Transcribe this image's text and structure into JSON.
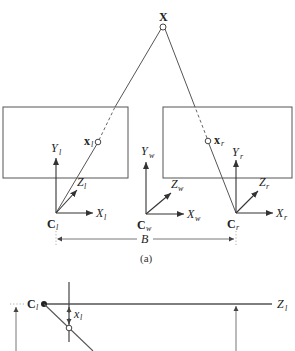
{
  "diagram": {
    "world_point": {
      "label": "X"
    },
    "left_camera": {
      "image_point": {
        "label": "x",
        "subscript": "l"
      },
      "center": {
        "label": "C",
        "subscript": "l"
      },
      "axes": {
        "x": {
          "label": "X",
          "sub": "l"
        },
        "y": {
          "label": "Y",
          "sub": "l"
        },
        "z": {
          "label": "Z",
          "sub": "l"
        }
      }
    },
    "world_frame": {
      "center": {
        "label": "C",
        "subscript": "w"
      },
      "axes": {
        "x": {
          "label": "X",
          "sub": "w"
        },
        "y": {
          "label": "Y",
          "sub": "w"
        },
        "z": {
          "label": "Z",
          "sub": "w"
        }
      }
    },
    "right_camera": {
      "image_point": {
        "label": "x",
        "subscript": "r"
      },
      "center": {
        "label": "C",
        "subscript": "r"
      },
      "axes": {
        "x": {
          "label": "X",
          "sub": "r"
        },
        "y": {
          "label": "Y",
          "sub": "r"
        },
        "z": {
          "label": "Z",
          "sub": "r"
        }
      }
    },
    "baseline": {
      "label": "B"
    },
    "caption_a": "(a)",
    "bottom": {
      "center": {
        "label": "C",
        "subscript": "l"
      },
      "z_axis": {
        "label": "Z",
        "sub": "l"
      },
      "offset": {
        "label": "x",
        "sub": "l"
      }
    }
  }
}
